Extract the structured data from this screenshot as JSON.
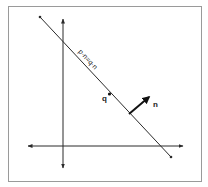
{
  "diagram": {
    "equation_label": "p·n=q·n",
    "point_label": "q",
    "normal_label": "n",
    "colors": {
      "background": "#ffffff",
      "frame": "#9a9a9a",
      "stroke": "#2a2a2a"
    },
    "elements": {
      "frame": {
        "x": 8,
        "y": 6,
        "w": 193,
        "h": 175
      },
      "x_axis": {
        "x1": 27,
        "y1": 146,
        "x2": 183,
        "y2": 146,
        "arrows": "both"
      },
      "y_axis": {
        "x1": 63,
        "y1": 18,
        "x2": 63,
        "y2": 168,
        "arrows": "both"
      },
      "plane_line": {
        "x1": 40,
        "y1": 17,
        "x2": 171,
        "y2": 157
      },
      "point_q": {
        "x": 109,
        "y": 94
      },
      "normal_vector": {
        "x1": 129,
        "y1": 114,
        "x2": 151,
        "y2": 96
      }
    }
  }
}
